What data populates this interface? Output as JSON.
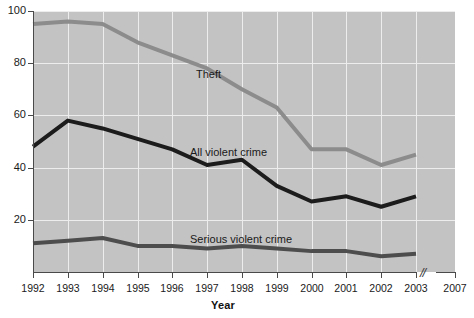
{
  "chart_data": {
    "type": "line",
    "title": "",
    "xlabel": "Year",
    "ylabel": "",
    "x": [
      1992,
      1993,
      1994,
      1995,
      1996,
      1997,
      1998,
      1999,
      2000,
      2001,
      2002,
      2003
    ],
    "x_tick_labels": [
      "1992",
      "1993",
      "1994",
      "1995",
      "1996",
      "1997",
      "1998",
      "1999",
      "2000",
      "2001",
      "2002",
      "2003",
      "2007"
    ],
    "axis_break": {
      "present": true,
      "between": [
        "2003",
        "2007"
      ],
      "glyph": "//"
    },
    "y_tick_labels": [
      "20",
      "40",
      "60",
      "80",
      "100"
    ],
    "y_ticks": [
      20,
      40,
      60,
      80,
      100
    ],
    "ylim": [
      0,
      100
    ],
    "grid": true,
    "legend_position": "inline-labels",
    "series": [
      {
        "name": "Theft",
        "color": "#8c8c8c",
        "label_x": 1996.3,
        "label_y": 74,
        "values": [
          95,
          96,
          95,
          88,
          83,
          78,
          70,
          63,
          47,
          47,
          41,
          45
        ]
      },
      {
        "name": "All violent crime",
        "color": "#1c1c1c",
        "label_x": 1996.1,
        "label_y": 47,
        "values": [
          48,
          58,
          55,
          51,
          47,
          41,
          43,
          33,
          27,
          29,
          25,
          29
        ]
      },
      {
        "name": "Serious violent crime",
        "color": "#4d4d4d",
        "label_x": 1996.0,
        "label_y": 18,
        "values": [
          11,
          12,
          13,
          10,
          10,
          9,
          10,
          9,
          8,
          8,
          6,
          7
        ]
      }
    ]
  },
  "axes": {
    "x_title": "Year",
    "y_ticks": [
      "100",
      "80",
      "60",
      "40",
      "20"
    ],
    "x_ticks": [
      "1992",
      "1993",
      "1994",
      "1995",
      "1996",
      "1997",
      "1998",
      "1999",
      "2000",
      "2001",
      "2002",
      "2003",
      "2007"
    ],
    "break_glyph": "//"
  },
  "labels": {
    "theft": "Theft",
    "all_violent_crime": "All violent crime",
    "serious_violent_crime": "Serious violent crime"
  },
  "colors": {
    "plot_background": "#c3c3c3",
    "gridline": "#ededed",
    "axis": "#4a4a4a",
    "theft": "#8c8c8c",
    "all_violent_crime": "#1c1c1c",
    "serious_violent_crime": "#4d4d4d",
    "page_background": "#ffffff"
  },
  "artifacts": {
    "top_edge_remnant": "",
    "bottom_edge_remnant": ""
  }
}
